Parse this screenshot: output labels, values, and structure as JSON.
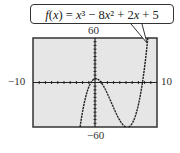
{
  "chart_data": {
    "type": "line",
    "title": "f(x) = x³ − 8x² + 2x + 5",
    "function": "x^3 - 8x^2 + 2x + 5",
    "series": [
      {
        "name": "f(x)",
        "style": "calculator-dotted",
        "color": "#222222"
      }
    ],
    "xlim": [
      -10,
      10
    ],
    "ylim": [
      -60,
      60
    ],
    "xscale_tick": 1,
    "yscale_tick": 5,
    "tick_labels": {
      "xmin": "−10",
      "xmax": "10",
      "ymax": "60",
      "ymin": "−60"
    },
    "grid": false,
    "background": "#e6e6e6",
    "sample_points": [
      {
        "x": -2.5,
        "y": -69.6
      },
      {
        "x": -2,
        "y": -35
      },
      {
        "x": -1,
        "y": -6
      },
      {
        "x": 0,
        "y": 5
      },
      {
        "x": 0.13,
        "y": 5.13
      },
      {
        "x": 1,
        "y": 0
      },
      {
        "x": 2,
        "y": -15
      },
      {
        "x": 3,
        "y": -34
      },
      {
        "x": 4,
        "y": -51
      },
      {
        "x": 5,
        "y": -60
      },
      {
        "x": 5.2,
        "y": -60.2
      },
      {
        "x": 6,
        "y": -55
      },
      {
        "x": 7,
        "y": -30
      },
      {
        "x": 7.7,
        "y": -0.9
      },
      {
        "x": 8,
        "y": 21
      },
      {
        "x": 8.5,
        "y": 50.2
      },
      {
        "x": 8.7,
        "y": 63.5
      }
    ]
  },
  "label": {
    "text": "f(x) = x³ − 8x² + 2x + 5"
  },
  "axes": {
    "ymax_label": "60",
    "ymin_label": "−60",
    "xmin_label": "−10",
    "xmax_label": "10"
  }
}
